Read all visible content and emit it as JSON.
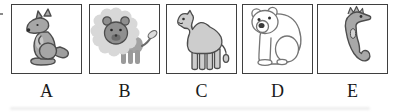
{
  "figure": {
    "options": [
      {
        "label": "A",
        "animal": "kangaroo-icon"
      },
      {
        "label": "B",
        "animal": "lion-icon"
      },
      {
        "label": "C",
        "animal": "camel-icon"
      },
      {
        "label": "D",
        "animal": "polar-bear-icon"
      },
      {
        "label": "E",
        "animal": "seahorse-icon"
      }
    ],
    "colors": {
      "background": "#ffffff",
      "box_border": "#3f3f3f",
      "label_text": "#1a1a1a",
      "animal_gray": "#a6a6a6",
      "animal_outline": "#4d4d4d",
      "lion_mane_gray": "#d8d8d8",
      "lion_face_gray": "#8f8f8f",
      "camel_gray": "#cdcdcd",
      "bear_white": "#ffffff",
      "bear_outline": "#757575",
      "seahorse_gray": "#a8a8a8"
    }
  }
}
